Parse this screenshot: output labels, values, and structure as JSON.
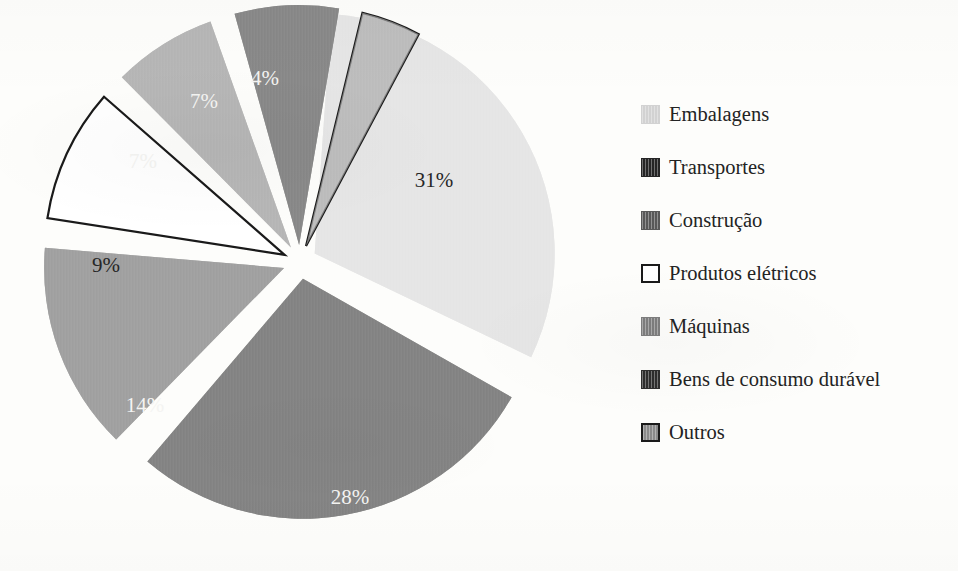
{
  "chart_data": {
    "type": "pie",
    "title": "",
    "subtitle": "",
    "xlabel": "",
    "ylabel": "",
    "legend_position": "right",
    "grid": false,
    "exploded": true,
    "value_unit": "%",
    "categories": [
      "Embalagens",
      "Transportes",
      "Construção",
      "Produtos elétricos",
      "Máquinas",
      "Bens de consumo durável",
      "Outros"
    ],
    "values": [
      31,
      28,
      14,
      9,
      7,
      7,
      4
    ],
    "data_labels": [
      "31%",
      "28%",
      "14%",
      "9%",
      "7%",
      "7%",
      "4%"
    ],
    "total": 100,
    "slices": [
      {
        "label": "Embalagens",
        "value": 31,
        "data_label": "31%",
        "fill": "#d2d2d2",
        "stroke": "none",
        "label_color": "#272727",
        "start_deg": 4,
        "end_deg": 115.6,
        "label_x": 434,
        "label_y": 187
      },
      {
        "label": "Transportes",
        "value": 28,
        "data_label": "28%",
        "fill": "#252525",
        "stroke": "none",
        "label_color": "#f4f4f2",
        "start_deg": 119.6,
        "end_deg": 220.4,
        "label_x": 350,
        "label_y": 504
      },
      {
        "label": "Construção",
        "value": 14,
        "data_label": "14%",
        "fill": "#585858",
        "stroke": "none",
        "label_color": "#f4f4f2",
        "start_deg": 224.4,
        "end_deg": 274.8,
        "label_x": 145,
        "label_y": 412
      },
      {
        "label": "Produtos elétricos",
        "value": 9,
        "data_label": "9%",
        "fill": "#ffffff",
        "stroke": "#1a1a1a",
        "label_color": "#272727",
        "start_deg": 278.8,
        "end_deg": 311.2,
        "label_x": 106,
        "label_y": 272
      },
      {
        "label": "Máquinas",
        "value": 7,
        "data_label": "7%",
        "fill": "#7e7e7e",
        "stroke": "none",
        "label_color": "#f4f4f2",
        "start_deg": 315.2,
        "end_deg": 340.4,
        "label_x": 143,
        "label_y": 168
      },
      {
        "label": "Bens de consumo durável",
        "value": 7,
        "data_label": "7%",
        "fill": "#2e2e2e",
        "stroke": "none",
        "label_color": "#f4f4f2",
        "start_deg": 344.4,
        "end_deg": 369.6,
        "label_x": 204,
        "label_y": 108
      },
      {
        "label": "Outros",
        "value": 4,
        "data_label": "4%",
        "fill": "#8a8a8a",
        "stroke": "#1a1a1a",
        "label_color": "#f4f4f2",
        "start_deg": 373.6,
        "end_deg": 388,
        "label_x": 265,
        "label_y": 85
      }
    ]
  },
  "legend": {
    "items": [
      {
        "label": "Embalagens",
        "swatch": "#d2d2d2",
        "border": "none"
      },
      {
        "label": "Transportes",
        "swatch": "#252525",
        "border": "none"
      },
      {
        "label": "Construção",
        "swatch": "#585858",
        "border": "none"
      },
      {
        "label": "Produtos elétricos",
        "swatch": "#ffffff",
        "border": "#1a1a1a"
      },
      {
        "label": "Máquinas",
        "swatch": "#7e7e7e",
        "border": "none"
      },
      {
        "label": "Bens de consumo durável",
        "swatch": "#2e2e2e",
        "border": "none"
      },
      {
        "label": "Outros",
        "swatch": "#8a8a8a",
        "border": "#1a1a1a"
      }
    ]
  },
  "colors": {
    "background": "#fdfdfb",
    "text": "#232323",
    "outline": "#1a1a1a"
  }
}
